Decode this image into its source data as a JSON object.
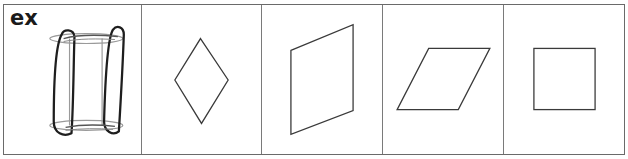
{
  "worksheet": {
    "example_label": "ex",
    "cells": [
      {
        "id": "example",
        "shape": "hand-drawn-rectangular-prism-sketch",
        "is_example": true
      },
      {
        "id": "1",
        "shape": "rhombus-vertical",
        "points": [
          [
            200,
            38
          ],
          [
            228,
            80
          ],
          [
            201,
            124
          ],
          [
            174,
            80
          ]
        ]
      },
      {
        "id": "2",
        "shape": "parallelogram-tilted",
        "points": [
          [
            290,
            50
          ],
          [
            353,
            24
          ],
          [
            353,
            111
          ],
          [
            290,
            135
          ]
        ]
      },
      {
        "id": "3",
        "shape": "parallelogram-slanted",
        "points": [
          [
            428,
            48
          ],
          [
            490,
            48
          ],
          [
            458,
            110
          ],
          [
            396,
            110
          ]
        ]
      },
      {
        "id": "4",
        "shape": "square",
        "points": [
          [
            534,
            48
          ],
          [
            596,
            48
          ],
          [
            596,
            110
          ],
          [
            534,
            110
          ]
        ]
      }
    ],
    "colors": {
      "border": "#6a6a6a",
      "shape_stroke": "#3a3a3a",
      "sketch_stroke": "#1e1e1e",
      "text": "#1a1a1a"
    }
  }
}
